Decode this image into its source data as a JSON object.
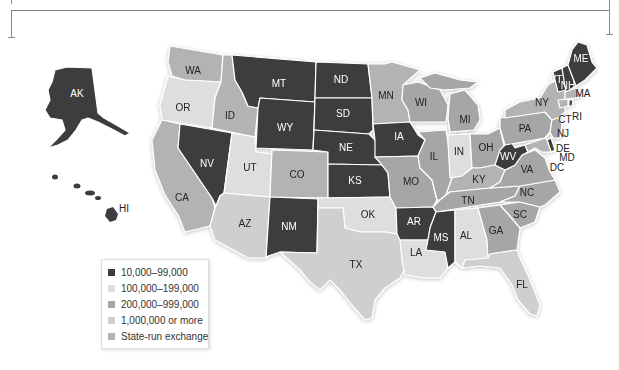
{
  "colors": {
    "cat_10k_99k": "#3d3d3f",
    "cat_100k_199k": "#dedede",
    "cat_200k_999k": "#a6a6a6",
    "cat_1m_plus": "#cfcfcf",
    "state_run": "#b3b3b3"
  },
  "legend": {
    "items": [
      {
        "label": "10,000–99,000",
        "color": "#3d3d3f"
      },
      {
        "label": "100,000–199,000",
        "color": "#dedede"
      },
      {
        "label": "200,000–999,000",
        "color": "#a6a6a6"
      },
      {
        "label": "1,000,000 or more",
        "color": "#cfcfcf"
      },
      {
        "label": "State-run exchange",
        "color": "#b3b3b3"
      }
    ]
  },
  "states": {
    "AK": {
      "label": "AK",
      "category": "10,000–99,000"
    },
    "HI": {
      "label": "HI",
      "category": "10,000–99,000"
    },
    "WA": {
      "label": "WA",
      "category": "State-run exchange"
    },
    "OR": {
      "label": "OR",
      "category": "100,000–199,000"
    },
    "CA": {
      "label": "CA",
      "category": "State-run exchange"
    },
    "ID": {
      "label": "ID",
      "category": "State-run exchange"
    },
    "NV": {
      "label": "NV",
      "category": "10,000–99,000"
    },
    "UT": {
      "label": "UT",
      "category": "100,000–199,000"
    },
    "AZ": {
      "label": "AZ",
      "category": "1,000,000 or more"
    },
    "MT": {
      "label": "MT",
      "category": "10,000–99,000"
    },
    "WY": {
      "label": "WY",
      "category": "10,000–99,000"
    },
    "CO": {
      "label": "CO",
      "category": "State-run exchange"
    },
    "NM": {
      "label": "NM",
      "category": "10,000–99,000"
    },
    "ND": {
      "label": "ND",
      "category": "10,000–99,000"
    },
    "SD": {
      "label": "SD",
      "category": "10,000–99,000"
    },
    "NE": {
      "label": "NE",
      "category": "10,000–99,000"
    },
    "KS": {
      "label": "KS",
      "category": "10,000–99,000"
    },
    "OK": {
      "label": "OK",
      "category": "100,000–199,000"
    },
    "TX": {
      "label": "TX",
      "category": "1,000,000 or more"
    },
    "MN": {
      "label": "MN",
      "category": "State-run exchange"
    },
    "IA": {
      "label": "IA",
      "category": "10,000–99,000"
    },
    "MO": {
      "label": "MO",
      "category": "200,000–999,000"
    },
    "AR": {
      "label": "AR",
      "category": "10,000–99,000"
    },
    "LA": {
      "label": "LA",
      "category": "100,000–199,000"
    },
    "WI": {
      "label": "WI",
      "category": "200,000–999,000"
    },
    "IL": {
      "label": "IL",
      "category": "200,000–999,000"
    },
    "MI": {
      "label": "MI",
      "category": "200,000–999,000"
    },
    "IN": {
      "label": "IN",
      "category": "100,000–199,000"
    },
    "OH": {
      "label": "OH",
      "category": "200,000–999,000"
    },
    "KY": {
      "label": "KY",
      "category": "State-run exchange"
    },
    "TN": {
      "label": "TN",
      "category": "200,000–999,000"
    },
    "MS": {
      "label": "MS",
      "category": "10,000–99,000"
    },
    "AL": {
      "label": "AL",
      "category": "100,000–199,000"
    },
    "GA": {
      "label": "GA",
      "category": "200,000–999,000"
    },
    "FL": {
      "label": "FL",
      "category": "1,000,000 or more"
    },
    "SC": {
      "label": "SC",
      "category": "200,000–999,000"
    },
    "NC": {
      "label": "NC",
      "category": "200,000–999,000"
    },
    "VA": {
      "label": "VA",
      "category": "200,000–999,000"
    },
    "WV": {
      "label": "WV",
      "category": "10,000–99,000"
    },
    "PA": {
      "label": "PA",
      "category": "200,000–999,000"
    },
    "NY": {
      "label": "NY",
      "category": "State-run exchange"
    },
    "VT": {
      "label": "VT",
      "category": "10,000–99,000"
    },
    "NH": {
      "label": "NH",
      "category": "10,000–99,000"
    },
    "ME": {
      "label": "ME",
      "category": "10,000–99,000"
    },
    "MA": {
      "label": "MA",
      "category": "State-run exchange"
    },
    "RI": {
      "label": "RI",
      "category": "State-run exchange"
    },
    "CT": {
      "label": "CT",
      "category": "State-run exchange"
    },
    "NJ": {
      "label": "NJ",
      "category": "200,000–999,000"
    },
    "DE": {
      "label": "DE",
      "category": "10,000–99,000"
    },
    "MD": {
      "label": "MD",
      "category": "State-run exchange"
    },
    "DC": {
      "label": "DC",
      "category": "State-run exchange"
    }
  }
}
